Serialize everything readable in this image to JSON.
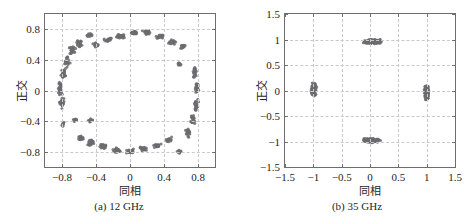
{
  "figure": {
    "background": "#ffffff",
    "marker_color": "#6b6b70",
    "axis_color": "#6e6e6e",
    "grid_color": "#c9c9c9"
  },
  "panels": [
    {
      "id": "a",
      "caption": "(a) 12 GHz",
      "xlabel": "同相",
      "ylabel": "正交",
      "xticklabels": [
        "−0.8",
        "−0.4",
        "0",
        "0.4",
        "0.8"
      ],
      "yticklabels": [
        "0.8",
        "0.4",
        "0",
        "−0.4",
        "−0.8"
      ]
    },
    {
      "id": "b",
      "caption": "(b) 35 GHz",
      "xlabel": "同相",
      "ylabel": "正交",
      "xticklabels": [
        "−1.5",
        "−1",
        "−0.5",
        "0",
        "0.5",
        "1",
        "1.5"
      ],
      "yticklabels": [
        "1.5",
        "1",
        "0.5",
        "0",
        "−0.5",
        "−1",
        "−1.5"
      ]
    }
  ],
  "chart_data": [
    {
      "type": "scatter",
      "id": "a",
      "title": "(a) 12 GHz",
      "xlabel": "同相",
      "ylabel": "正交",
      "xlim": [
        -1.0,
        1.0
      ],
      "ylim": [
        -1.0,
        1.0
      ],
      "xticks": [
        -0.8,
        -0.4,
        0,
        0.4,
        0.8
      ],
      "yticks": [
        -0.8,
        -0.4,
        0,
        0.4,
        0.8
      ],
      "grid": true,
      "legend": null,
      "marker_color": "#6b6b70",
      "description": "Dense ring-shaped constellation of received symbols forming a near-circular annulus of radius ~0.8, with several small detached clusters offset inside and outside the ring.",
      "clusters": [
        {
          "cx": -0.82,
          "cy": 0.04,
          "n": 34,
          "rx": 0.035,
          "ry": 0.13
        },
        {
          "cx": -0.8,
          "cy": -0.16,
          "n": 26,
          "rx": 0.035,
          "ry": 0.1
        },
        {
          "cx": -0.78,
          "cy": 0.22,
          "n": 26,
          "rx": 0.04,
          "ry": 0.1
        },
        {
          "cx": -0.74,
          "cy": 0.38,
          "n": 24,
          "rx": 0.045,
          "ry": 0.09
        },
        {
          "cx": -0.68,
          "cy": 0.52,
          "n": 24,
          "rx": 0.05,
          "ry": 0.08
        },
        {
          "cx": -0.6,
          "cy": 0.62,
          "n": 20,
          "rx": 0.055,
          "ry": 0.06
        },
        {
          "cx": -0.47,
          "cy": 0.73,
          "n": 14,
          "rx": 0.045,
          "ry": 0.04
        },
        {
          "cx": -0.4,
          "cy": 0.6,
          "n": 16,
          "rx": 0.045,
          "ry": 0.05
        },
        {
          "cx": -0.26,
          "cy": 0.66,
          "n": 22,
          "rx": 0.06,
          "ry": 0.04
        },
        {
          "cx": -0.1,
          "cy": 0.71,
          "n": 26,
          "rx": 0.07,
          "ry": 0.04
        },
        {
          "cx": 0.06,
          "cy": 0.76,
          "n": 28,
          "rx": 0.07,
          "ry": 0.04
        },
        {
          "cx": 0.2,
          "cy": 0.76,
          "n": 26,
          "rx": 0.07,
          "ry": 0.04
        },
        {
          "cx": 0.36,
          "cy": 0.71,
          "n": 24,
          "rx": 0.065,
          "ry": 0.04
        },
        {
          "cx": 0.5,
          "cy": 0.64,
          "n": 22,
          "rx": 0.06,
          "ry": 0.05
        },
        {
          "cx": 0.62,
          "cy": 0.58,
          "n": 16,
          "rx": 0.045,
          "ry": 0.05
        },
        {
          "cx": 0.58,
          "cy": 0.34,
          "n": 10,
          "rx": 0.03,
          "ry": 0.035
        },
        {
          "cx": 0.76,
          "cy": 0.24,
          "n": 22,
          "rx": 0.035,
          "ry": 0.09
        },
        {
          "cx": 0.79,
          "cy": 0.04,
          "n": 26,
          "rx": 0.03,
          "ry": 0.11
        },
        {
          "cx": 0.78,
          "cy": -0.18,
          "n": 26,
          "rx": 0.032,
          "ry": 0.11
        },
        {
          "cx": 0.74,
          "cy": -0.38,
          "n": 24,
          "rx": 0.035,
          "ry": 0.09
        },
        {
          "cx": 0.68,
          "cy": -0.55,
          "n": 20,
          "rx": 0.04,
          "ry": 0.07
        },
        {
          "cx": 0.58,
          "cy": -0.8,
          "n": 12,
          "rx": 0.035,
          "ry": 0.035
        },
        {
          "cx": 0.46,
          "cy": -0.64,
          "n": 18,
          "rx": 0.05,
          "ry": 0.05
        },
        {
          "cx": 0.32,
          "cy": -0.72,
          "n": 22,
          "rx": 0.06,
          "ry": 0.04
        },
        {
          "cx": 0.16,
          "cy": -0.76,
          "n": 24,
          "rx": 0.065,
          "ry": 0.04
        },
        {
          "cx": 0.0,
          "cy": -0.79,
          "n": 26,
          "rx": 0.07,
          "ry": 0.04
        },
        {
          "cx": -0.16,
          "cy": -0.78,
          "n": 26,
          "rx": 0.07,
          "ry": 0.04
        },
        {
          "cx": -0.32,
          "cy": -0.73,
          "n": 24,
          "rx": 0.065,
          "ry": 0.04
        },
        {
          "cx": -0.46,
          "cy": -0.68,
          "n": 22,
          "rx": 0.055,
          "ry": 0.05
        },
        {
          "cx": -0.58,
          "cy": -0.62,
          "n": 16,
          "rx": 0.045,
          "ry": 0.05
        },
        {
          "cx": -0.64,
          "cy": -0.38,
          "n": 12,
          "rx": 0.035,
          "ry": 0.04
        },
        {
          "cx": -0.79,
          "cy": -0.44,
          "n": 10,
          "rx": 0.028,
          "ry": 0.035
        },
        {
          "cx": -0.46,
          "cy": -0.39,
          "n": 14,
          "rx": 0.042,
          "ry": 0.032
        }
      ]
    },
    {
      "type": "scatter",
      "id": "b",
      "title": "(b) 35 GHz",
      "xlabel": "同相",
      "ylabel": "正交",
      "xlim": [
        -1.5,
        1.5
      ],
      "ylim": [
        -1.5,
        1.5
      ],
      "xticks": [
        -1.5,
        -1,
        -0.5,
        0,
        0.5,
        1,
        1.5
      ],
      "yticks": [
        -1.5,
        -1,
        -0.5,
        0,
        0.5,
        1,
        1.5
      ],
      "grid": true,
      "legend": null,
      "marker_color": "#6b6b70",
      "description": "QPSK-like constellation with four compact symbol clouds located near (0, 1), (0, -1), (-1, 0) and (1, 0). Horizontal clouds are wide and flat; vertical clouds are tall and narrow.",
      "clusters": [
        {
          "cx": 0.05,
          "cy": 0.96,
          "n": 150,
          "rx": 0.2,
          "ry": 0.055
        },
        {
          "cx": 0.02,
          "cy": -0.98,
          "n": 150,
          "rx": 0.19,
          "ry": 0.05
        },
        {
          "cx": -0.99,
          "cy": 0.02,
          "n": 150,
          "rx": 0.055,
          "ry": 0.16
        },
        {
          "cx": 1.0,
          "cy": -0.03,
          "n": 150,
          "rx": 0.05,
          "ry": 0.17
        }
      ]
    }
  ]
}
